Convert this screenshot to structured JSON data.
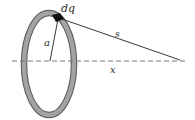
{
  "diagram": {
    "type": "charged-ring-axis-field",
    "labels": {
      "charge_element": "dq",
      "radius": "a",
      "distance": "s",
      "axis_distance": "x"
    },
    "colors": {
      "ring_fill": "#9a9a9a",
      "ring_edge": "#555555",
      "line": "#222222",
      "axis": "#777777",
      "charge_element": "#111111"
    }
  }
}
